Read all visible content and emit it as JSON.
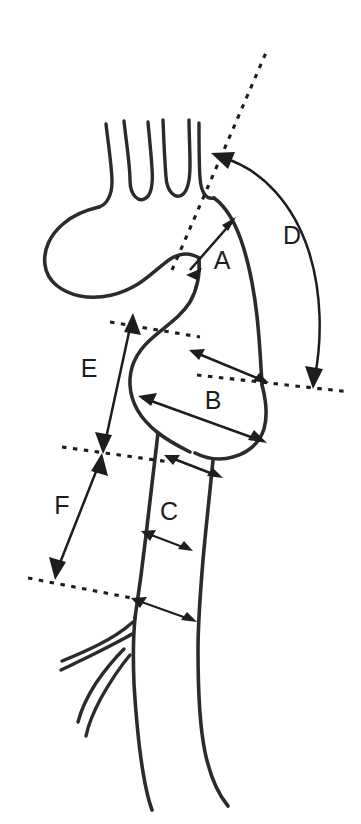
{
  "figure": {
    "title": "Aortic arch measurement diagram",
    "background_color": "#ffffff",
    "line_color": "#2b2b2b",
    "annotation_color": "#1d1d1d"
  },
  "labels": {
    "a": "A",
    "b": "B",
    "c": "C",
    "d": "D",
    "e": "E",
    "f": "F"
  },
  "measurements": [
    {
      "id": "A",
      "label": "A",
      "kind": "double-headed-straight-arrow",
      "orientation": "diagonal",
      "description": "Distance from the upper dashed reference line to the outer curvature of the ascending aorta"
    },
    {
      "id": "B",
      "label": "B",
      "kind": "double-headed-straight-arrow",
      "orientation": "diagonal",
      "description": "Maximum diameter across the aortic root sinus bulb"
    },
    {
      "id": "C",
      "label": "C",
      "kind": "double-headed-straight-arrow",
      "orientation": "diagonal",
      "description": "Diameter across the descending aorta"
    },
    {
      "id": "D",
      "label": "D",
      "kind": "double-headed-curved-arrow",
      "orientation": "arc",
      "description": "Curved arc length along the outer aortic arch between the upper and lower dashed reference lines"
    },
    {
      "id": "E",
      "label": "E",
      "kind": "double-headed-straight-arrow",
      "orientation": "vertical",
      "description": "Vertical distance between the upper-middle dashed reference line and the middle dashed reference line"
    },
    {
      "id": "F",
      "label": "F",
      "kind": "double-headed-straight-arrow",
      "orientation": "vertical",
      "description": "Vertical distance between the middle dashed reference line and the lower dashed reference line"
    }
  ],
  "reference_lines": [
    {
      "id": "upper-oblique",
      "style": "dashed",
      "description": "Long oblique dashed line running from the aortic root upward and to the right past the arch"
    },
    {
      "id": "arch-lower-oblique",
      "style": "dashed",
      "description": "Short dashed line crossing at the level of the sinotubular junction on the right"
    },
    {
      "id": "sinus-upper",
      "style": "dashed",
      "description": "Dashed line at the top of the aortic root sinus"
    },
    {
      "id": "sinus-lower",
      "style": "dashed",
      "description": "Dashed line at the bottom of the aortic root sinus"
    },
    {
      "id": "lower",
      "style": "dashed",
      "description": "Dashed line at the level of the distal descending aorta branch origin"
    }
  ],
  "anatomy_parts": [
    {
      "id": "supra-aortic-branches",
      "label": "Supra-aortic branch vessels",
      "count": 3
    },
    {
      "id": "aortic-arch",
      "label": "Aortic arch"
    },
    {
      "id": "ascending-aorta",
      "label": "Ascending aorta"
    },
    {
      "id": "aortic-root-sinus",
      "label": "Aortic root sinus / bulb"
    },
    {
      "id": "descending-aorta",
      "label": "Descending aorta"
    },
    {
      "id": "distal-branches",
      "label": "Distal branch vessels",
      "count": 3
    }
  ]
}
